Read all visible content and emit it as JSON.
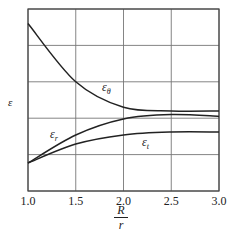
{
  "chart_data": {
    "type": "line",
    "title": "",
    "xlabel": "R/r",
    "xlabel_num": "R",
    "xlabel_den": "r",
    "ylabel": "ε",
    "xlim": [
      1.0,
      3.0
    ],
    "ylim": [
      0,
      5
    ],
    "grid": true,
    "x_ticks": [
      "1.0",
      "1.5",
      "2.0",
      "2.5",
      "3.0"
    ],
    "y_ticks": [],
    "x": [
      1.0,
      1.5,
      2.0,
      2.5,
      3.0
    ],
    "series": [
      {
        "name": "ε_θ",
        "label": "εθ",
        "values": [
          4.6,
          3.0,
          2.3,
          2.2,
          2.2
        ]
      },
      {
        "name": "ε_r",
        "label": "εr",
        "values": [
          0.77,
          1.54,
          1.98,
          2.1,
          2.05
        ]
      },
      {
        "name": "ε_t",
        "label": "εt",
        "values": [
          0.77,
          1.29,
          1.54,
          1.62,
          1.62
        ]
      }
    ],
    "legend": "inline labels"
  },
  "labels": {
    "eps_theta_main": "ε",
    "eps_theta_sub": "θ",
    "eps_r_main": "ε",
    "eps_r_sub": "r",
    "eps_t_main": "ε",
    "eps_t_sub": "t",
    "y_axis": "ε",
    "x_num": "R",
    "x_den": "r"
  }
}
